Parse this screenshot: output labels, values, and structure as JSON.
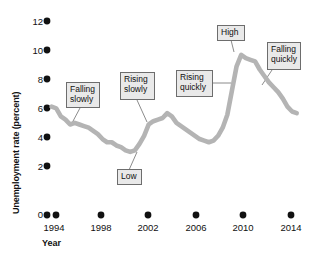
{
  "chart_data": {
    "type": "line",
    "title": "",
    "xlabel": "Year",
    "ylabel": "Unemployment rate (percent)",
    "xlim": [
      1993.2,
      2015.0
    ],
    "ylim": [
      0,
      12
    ],
    "grid": false,
    "legend": "none",
    "line_color": "#b4b4b4",
    "xticks": [
      "1994",
      "1998",
      "2002",
      "2006",
      "2010",
      "2014"
    ],
    "xtick_values": [
      1994,
      1998,
      2002,
      2006,
      2010,
      2014
    ],
    "yticks": [
      "0",
      "2",
      "4",
      "6",
      "8",
      "10",
      "12"
    ],
    "ytick_values": [
      0,
      2,
      4,
      6,
      8,
      10,
      12
    ],
    "x": [
      1993.6,
      1994.0,
      1994.4,
      1994.8,
      1995.2,
      1995.6,
      1996.0,
      1996.4,
      1996.8,
      1997.2,
      1997.6,
      1998.0,
      1998.4,
      1998.8,
      1999.2,
      1999.6,
      2000.0,
      2000.4,
      2000.8,
      2001.2,
      2001.6,
      2002.0,
      2002.4,
      2002.8,
      2003.2,
      2003.6,
      2004.0,
      2004.4,
      2004.8,
      2005.2,
      2005.6,
      2006.0,
      2006.4,
      2006.8,
      2007.2,
      2007.6,
      2008.0,
      2008.4,
      2008.8,
      2009.2,
      2009.6,
      2010.0,
      2010.4,
      2010.8,
      2011.2,
      2011.6,
      2012.0,
      2012.4,
      2012.8,
      2013.2,
      2013.6,
      2014.0,
      2014.4,
      2014.8
    ],
    "y": [
      6.7,
      6.6,
      6.1,
      5.9,
      5.6,
      5.7,
      5.6,
      5.5,
      5.4,
      5.2,
      5.0,
      4.7,
      4.5,
      4.5,
      4.3,
      4.2,
      4.0,
      3.9,
      4.0,
      4.4,
      4.9,
      5.6,
      5.8,
      5.9,
      6.0,
      6.3,
      6.1,
      5.7,
      5.5,
      5.3,
      5.1,
      4.9,
      4.7,
      4.6,
      4.5,
      4.6,
      4.9,
      5.4,
      6.2,
      7.7,
      9.2,
      9.9,
      9.7,
      9.6,
      9.5,
      9.0,
      8.6,
      8.2,
      7.9,
      7.6,
      7.2,
      6.7,
      6.4,
      6.3
    ]
  },
  "annotations": [
    {
      "id": "falling-slowly",
      "text": "Falling\nslowly"
    },
    {
      "id": "low",
      "text": "Low"
    },
    {
      "id": "rising-slowly",
      "text": "Rising\nslowly"
    },
    {
      "id": "rising-quickly",
      "text": "Rising\nquickly"
    },
    {
      "id": "high",
      "text": "High"
    },
    {
      "id": "falling-quickly",
      "text": "Falling\nquickly"
    }
  ]
}
